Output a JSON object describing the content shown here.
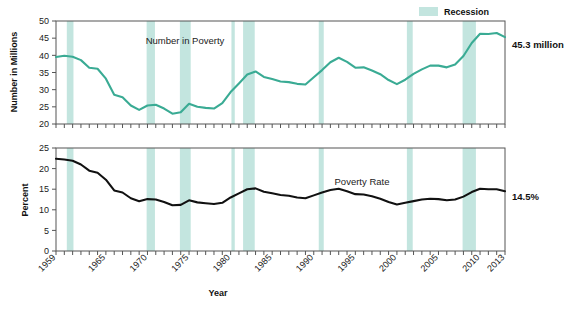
{
  "chart_data": [
    {
      "type": "line",
      "title": "",
      "series_label": "Number in Poverty",
      "xlabel": "",
      "ylabel": "Number in Millions",
      "ylim": [
        20,
        50
      ],
      "yticks": [
        20,
        25,
        30,
        35,
        40,
        45,
        50
      ],
      "xlim": [
        1959,
        2013
      ],
      "xticks": [
        1959,
        1965,
        1970,
        1975,
        1980,
        1985,
        1990,
        1995,
        2000,
        2005,
        2010,
        2013
      ],
      "grid": false,
      "line_color": "#3aab94",
      "end_annotation": "45.3 million",
      "x": [
        1959,
        1960,
        1961,
        1962,
        1963,
        1964,
        1965,
        1966,
        1967,
        1968,
        1969,
        1970,
        1971,
        1972,
        1973,
        1974,
        1975,
        1976,
        1977,
        1978,
        1979,
        1980,
        1981,
        1982,
        1983,
        1984,
        1985,
        1986,
        1987,
        1988,
        1989,
        1990,
        1991,
        1992,
        1993,
        1994,
        1995,
        1996,
        1997,
        1998,
        1999,
        2000,
        2001,
        2002,
        2003,
        2004,
        2005,
        2006,
        2007,
        2008,
        2009,
        2010,
        2011,
        2012,
        2013
      ],
      "values": [
        39.5,
        39.9,
        39.6,
        38.6,
        36.4,
        36.1,
        33.2,
        28.5,
        27.8,
        25.4,
        24.1,
        25.4,
        25.6,
        24.5,
        23.0,
        23.4,
        25.9,
        25.0,
        24.7,
        24.5,
        26.1,
        29.3,
        31.8,
        34.4,
        35.3,
        33.7,
        33.1,
        32.4,
        32.2,
        31.7,
        31.5,
        33.6,
        35.7,
        38.0,
        39.3,
        38.1,
        36.4,
        36.5,
        35.6,
        34.5,
        32.8,
        31.6,
        32.9,
        34.6,
        35.9,
        37.0,
        37.0,
        36.5,
        37.3,
        39.8,
        43.6,
        46.3,
        46.2,
        46.5,
        45.3
      ]
    },
    {
      "type": "line",
      "title": "",
      "series_label": "Poverty Rate",
      "xlabel": "Year",
      "ylabel": "Percent",
      "ylim": [
        0,
        25
      ],
      "yticks": [
        0,
        5,
        10,
        15,
        20,
        25
      ],
      "xlim": [
        1959,
        2013
      ],
      "xticks": [
        1959,
        1965,
        1970,
        1975,
        1980,
        1985,
        1990,
        1995,
        2000,
        2005,
        2010,
        2013
      ],
      "grid": false,
      "line_color": "#111111",
      "end_annotation": "14.5%",
      "x": [
        1959,
        1960,
        1961,
        1962,
        1963,
        1964,
        1965,
        1966,
        1967,
        1968,
        1969,
        1970,
        1971,
        1972,
        1973,
        1974,
        1975,
        1976,
        1977,
        1978,
        1979,
        1980,
        1981,
        1982,
        1983,
        1984,
        1985,
        1986,
        1987,
        1988,
        1989,
        1990,
        1991,
        1992,
        1993,
        1994,
        1995,
        1996,
        1997,
        1998,
        1999,
        2000,
        2001,
        2002,
        2003,
        2004,
        2005,
        2006,
        2007,
        2008,
        2009,
        2010,
        2011,
        2012,
        2013
      ],
      "values": [
        22.4,
        22.2,
        21.9,
        21.0,
        19.5,
        19.0,
        17.3,
        14.7,
        14.2,
        12.8,
        12.1,
        12.6,
        12.5,
        11.9,
        11.1,
        11.2,
        12.3,
        11.8,
        11.6,
        11.4,
        11.7,
        13.0,
        14.0,
        15.0,
        15.2,
        14.4,
        14.0,
        13.6,
        13.4,
        13.0,
        12.8,
        13.5,
        14.2,
        14.8,
        15.1,
        14.5,
        13.8,
        13.7,
        13.3,
        12.7,
        11.9,
        11.3,
        11.7,
        12.1,
        12.5,
        12.7,
        12.6,
        12.3,
        12.5,
        13.2,
        14.3,
        15.1,
        15.0,
        15.0,
        14.5
      ]
    }
  ],
  "legend": {
    "label": "Recession",
    "swatch_color": "#bfe3dd"
  },
  "recessions": [
    {
      "start": 1960.3,
      "end": 1961.1
    },
    {
      "start": 1969.9,
      "end": 1970.9
    },
    {
      "start": 1973.9,
      "end": 1975.2
    },
    {
      "start": 1980.1,
      "end": 1980.5
    },
    {
      "start": 1981.5,
      "end": 1982.9
    },
    {
      "start": 1990.6,
      "end": 1991.2
    },
    {
      "start": 2001.2,
      "end": 2001.9
    },
    {
      "start": 2007.9,
      "end": 2009.5
    }
  ],
  "colors": {
    "recession_band": "#c3e5df",
    "poverty_number_line": "#3aab94",
    "poverty_rate_line": "#111111",
    "axis": "#555555",
    "background": "#ffffff"
  }
}
